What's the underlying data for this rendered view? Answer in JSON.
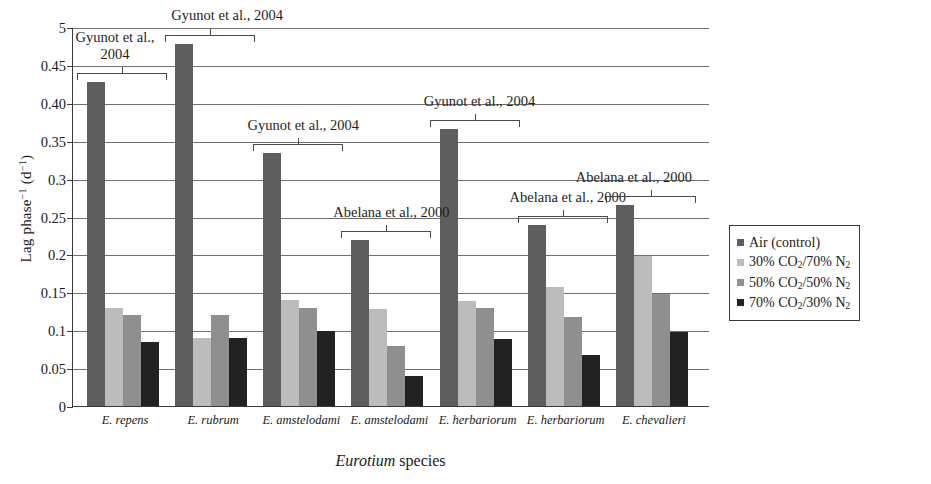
{
  "chart_data": {
    "type": "bar",
    "title": "",
    "xlabel": "Eurotium species",
    "ylabel": "Lag phase⁻¹ (d⁻¹)",
    "ylim": [
      0,
      0.5
    ],
    "grid": true,
    "legend_position": "right",
    "ytick_labels": [
      "0",
      "0.05",
      "0.1",
      "0.15",
      "0.2",
      "0.25",
      "0.3",
      "0.35",
      "0.40",
      "0.45",
      "5"
    ],
    "ytick_values": [
      0,
      0.05,
      0.1,
      0.15,
      0.2,
      0.25,
      0.3,
      0.35,
      0.4,
      0.45,
      0.5
    ],
    "categories": [
      "E. repens",
      "E. rubrum",
      "E. amstelodami",
      "E. amstelodami",
      "E. herbariorum",
      "E. herbariorum",
      "E. chevalieri"
    ],
    "series": [
      {
        "name": "Air (control)",
        "color": "#5e5e5e",
        "values": [
          0.428,
          0.477,
          0.334,
          0.219,
          0.365,
          0.239,
          0.265
        ]
      },
      {
        "name": "30% CO2/70% N2",
        "color": "#bcbcbc",
        "values": [
          0.129,
          0.09,
          0.14,
          0.128,
          0.138,
          0.157,
          0.198
        ]
      },
      {
        "name": "50% CO2/50% N2",
        "color": "#8f8f8f",
        "values": [
          0.12,
          0.12,
          0.129,
          0.079,
          0.129,
          0.118,
          0.148
        ]
      },
      {
        "name": "70% CO2/30% N2",
        "color": "#222222",
        "values": [
          0.085,
          0.09,
          0.099,
          0.039,
          0.088,
          0.067,
          0.098
        ]
      }
    ],
    "annotations": [
      {
        "text": "Gyunot et al., 2004",
        "group": 0
      },
      {
        "text": "Gyunot et al., 2004",
        "group": 1
      },
      {
        "text": "Gyunot et al., 2004",
        "group": 2
      },
      {
        "text": "Abelana et al., 2000",
        "group": 3
      },
      {
        "text": "Gyunot et al., 2004",
        "group": 4
      },
      {
        "text": "Abelana et al., 2000",
        "group": 5
      },
      {
        "text": "Abelana et al., 2000",
        "group": 6
      }
    ]
  },
  "legend": {
    "items": [
      {
        "label": "Air (control)",
        "sub1": "",
        "sub2": "",
        "color": "#5e5e5e",
        "plain": true
      },
      {
        "label": "30% CO",
        "sub1": "2",
        "mid": "/70% N",
        "sub2": "2",
        "color": "#bcbcbc",
        "plain": false
      },
      {
        "label": "50% CO",
        "sub1": "2",
        "mid": "/50% N",
        "sub2": "2",
        "color": "#8f8f8f",
        "plain": false
      },
      {
        "label": "70% CO",
        "sub1": "2",
        "mid": "/30% N",
        "sub2": "2",
        "color": "#222222",
        "plain": false
      }
    ]
  },
  "axis": {
    "y_title_main": "Lag phase",
    "y_title_sup1": "−1",
    "y_title_unit_open": " (d",
    "y_title_sup2": "−1",
    "y_title_unit_close": ")",
    "x_title_italic": "Eurotium",
    "x_title_rest": " species"
  }
}
